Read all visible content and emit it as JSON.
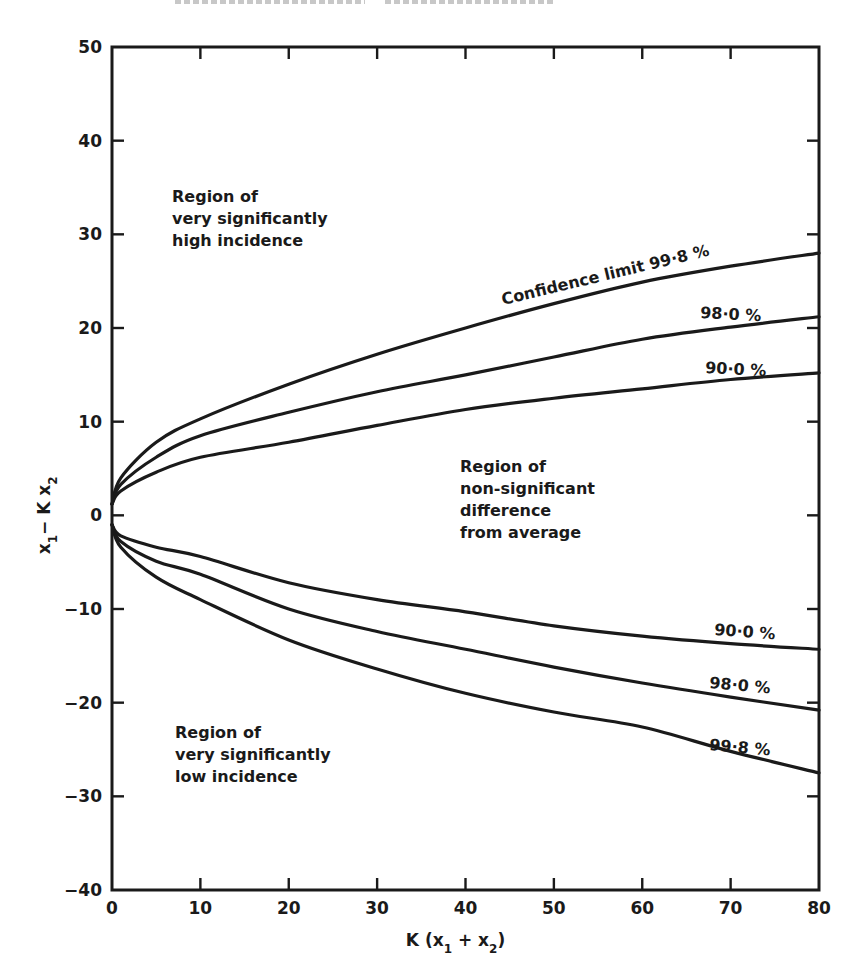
{
  "chart_data": {
    "type": "line",
    "title": "",
    "xlabel": "K (x1 + x2)",
    "ylabel": "x1 − K x2",
    "xlim": [
      0,
      80
    ],
    "ylim": [
      -40,
      50
    ],
    "xticks": [
      0,
      10,
      20,
      30,
      40,
      50,
      60,
      70,
      80
    ],
    "yticks": [
      50,
      40,
      30,
      20,
      10,
      0,
      -10,
      -20,
      -30,
      -40
    ],
    "grid": false,
    "legend": "none (curves labelled inline)",
    "x": [
      0,
      1,
      5,
      10,
      20,
      30,
      40,
      50,
      60,
      70,
      80
    ],
    "series": [
      {
        "name": "Upper 99.8%",
        "label": "Confidence limit 99·8 %",
        "values": [
          1.2,
          4.0,
          7.8,
          10.3,
          14.0,
          17.2,
          20.0,
          22.6,
          24.9,
          26.6,
          28.0
        ]
      },
      {
        "name": "Upper 98.0%",
        "label": "98·0 %",
        "values": [
          1.2,
          3.3,
          6.2,
          8.5,
          11.0,
          13.2,
          15.0,
          16.9,
          18.8,
          20.1,
          21.2
        ]
      },
      {
        "name": "Upper 90.0%",
        "label": "90·0 %",
        "values": [
          1.2,
          2.6,
          4.6,
          6.2,
          7.8,
          9.6,
          11.3,
          12.5,
          13.5,
          14.5,
          15.2
        ]
      },
      {
        "name": "Lower 90.0%",
        "label": "90·0 %",
        "values": [
          -1.0,
          -2.2,
          -3.4,
          -4.4,
          -7.2,
          -9.0,
          -10.3,
          -11.8,
          -12.9,
          -13.7,
          -14.3
        ]
      },
      {
        "name": "Lower 98.0%",
        "label": "98·0 %",
        "values": [
          -1.0,
          -2.8,
          -4.9,
          -6.3,
          -10.0,
          -12.4,
          -14.3,
          -16.2,
          -17.9,
          -19.4,
          -20.8
        ]
      },
      {
        "name": "Lower 99.8%",
        "label": "99·8 %",
        "values": [
          -1.0,
          -3.4,
          -6.6,
          -9.0,
          -13.3,
          -16.4,
          -19.0,
          -21.0,
          -22.6,
          -25.2,
          -27.5
        ]
      }
    ],
    "annotations": [
      {
        "lines": [
          "Region of",
          "very significantly",
          "high incidence"
        ],
        "x": 7,
        "y": 31
      },
      {
        "lines": [
          "Region of",
          "non-significant",
          "difference",
          "from average"
        ],
        "x": 39,
        "y": 5
      },
      {
        "lines": [
          "Region of",
          "very significantly",
          "low incidence"
        ],
        "x": 7,
        "y": -24
      }
    ]
  }
}
